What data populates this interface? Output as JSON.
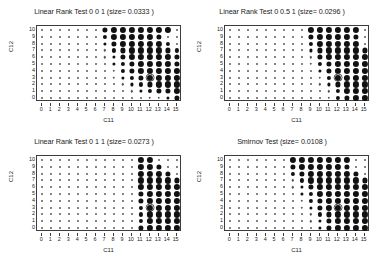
{
  "figure": {
    "background": "#ffffff",
    "marker_color": "#111111",
    "axis_color": "#3c3c3c",
    "layout": "2x2 grid of scatter panels"
  },
  "panels": [
    {
      "id": "panel-top-left",
      "title": "Linear Rank Test 0 0 1 (size= 0.0333 )",
      "xlabel": "C11",
      "ylabel": "C12"
    },
    {
      "id": "panel-top-right",
      "title": "Linear Rank Test 0 0.5 1 (size= 0.0296 )",
      "xlabel": "C11",
      "ylabel": "C12"
    },
    {
      "id": "panel-bottom-left",
      "title": "Linear Rank Test 0 1 1 (size= 0.0273 )",
      "xlabel": "C11",
      "ylabel": "C12"
    },
    {
      "id": "panel-bottom-right",
      "title": "Smirnov Test (size= 0.0108 )",
      "xlabel": "C11",
      "ylabel": "C12"
    }
  ],
  "axes_common": {
    "xticks": [
      0,
      1,
      2,
      3,
      4,
      5,
      6,
      7,
      8,
      9,
      10,
      11,
      12,
      13,
      14,
      15
    ],
    "yticks": [
      0,
      1,
      2,
      3,
      4,
      5,
      6,
      7,
      8,
      9,
      10
    ],
    "xlim": [
      -0.6,
      15.6
    ],
    "ylim": [
      -0.6,
      10.6
    ],
    "grid": false
  },
  "chart_data": [
    {
      "type": "scatter",
      "panel": "panel-top-left",
      "title": "Linear Rank Test 0 0 1 (size= 0.0333 )",
      "xlabel": "C11",
      "ylabel": "C12",
      "xlim": [
        -0.6,
        15.6
      ],
      "ylim": [
        -0.6,
        10.6
      ],
      "grid": false,
      "legend": null,
      "note": "Bubble plot: marker radius encodes test power at each (C11,C12) grid point. sizes[row] runs y=10 (top) down to y=0 (bottom); each row lists x=0..15.",
      "highlight": {
        "x": 12,
        "y": 3,
        "style": "open ring around marker"
      },
      "sizes": [
        [
          1,
          1,
          1,
          1,
          1,
          1,
          1,
          5,
          6,
          6,
          6,
          6,
          6,
          6,
          6,
          1
        ],
        [
          1,
          1,
          1,
          1,
          1,
          1,
          1,
          4,
          6,
          6,
          6,
          6,
          6,
          5,
          1,
          1
        ],
        [
          1,
          1,
          1,
          1,
          1,
          1,
          1,
          3,
          5,
          6,
          6,
          6,
          6,
          6,
          4,
          1
        ],
        [
          1,
          1,
          1,
          1,
          1,
          1,
          1,
          2,
          4,
          5,
          6,
          6,
          6,
          6,
          5,
          4
        ],
        [
          1,
          1,
          1,
          1,
          1,
          1,
          1,
          2,
          3,
          5,
          6,
          6,
          6,
          6,
          6,
          5
        ],
        [
          1,
          1,
          1,
          1,
          1,
          1,
          1,
          1,
          3,
          4,
          5,
          6,
          6,
          6,
          6,
          5
        ],
        [
          1,
          1,
          1,
          1,
          1,
          1,
          1,
          1,
          2,
          4,
          5,
          6,
          6,
          6,
          6,
          6
        ],
        [
          1,
          1,
          1,
          1,
          1,
          1,
          1,
          1,
          2,
          3,
          4,
          5,
          6,
          6,
          6,
          6
        ],
        [
          1,
          1,
          1,
          1,
          1,
          1,
          1,
          1,
          1,
          2,
          3,
          4,
          5,
          6,
          6,
          6
        ],
        [
          1,
          1,
          1,
          1,
          1,
          1,
          1,
          1,
          1,
          1,
          2,
          3,
          4,
          5,
          5,
          6
        ],
        [
          1,
          1,
          1,
          1,
          1,
          1,
          1,
          1,
          1,
          1,
          1,
          1,
          2,
          2,
          3,
          5
        ]
      ]
    },
    {
      "type": "scatter",
      "panel": "panel-top-right",
      "title": "Linear Rank Test 0 0.5 1 (size= 0.0296 )",
      "xlabel": "C11",
      "ylabel": "C12",
      "xlim": [
        -0.6,
        15.6
      ],
      "ylim": [
        -0.6,
        10.6
      ],
      "grid": false,
      "legend": null,
      "note": "Bubble plot: marker radius encodes test power at each (C11,C12) grid point.",
      "highlight": {
        "x": 12,
        "y": 3,
        "style": "open ring around marker"
      },
      "sizes": [
        [
          1,
          1,
          1,
          1,
          1,
          1,
          1,
          1,
          1,
          6,
          6,
          6,
          6,
          6,
          6,
          1
        ],
        [
          1,
          1,
          1,
          1,
          1,
          1,
          1,
          1,
          1,
          5,
          6,
          6,
          6,
          6,
          5,
          1
        ],
        [
          1,
          1,
          1,
          1,
          1,
          1,
          1,
          1,
          1,
          4,
          6,
          6,
          6,
          6,
          6,
          1
        ],
        [
          1,
          1,
          1,
          1,
          1,
          1,
          1,
          1,
          1,
          3,
          5,
          6,
          6,
          6,
          6,
          5
        ],
        [
          1,
          1,
          1,
          1,
          1,
          1,
          1,
          1,
          1,
          2,
          5,
          6,
          6,
          6,
          6,
          6
        ],
        [
          1,
          1,
          1,
          1,
          1,
          1,
          1,
          1,
          1,
          2,
          4,
          5,
          6,
          6,
          6,
          6
        ],
        [
          1,
          1,
          1,
          1,
          1,
          1,
          1,
          1,
          1,
          1,
          3,
          5,
          6,
          6,
          6,
          6
        ],
        [
          1,
          1,
          1,
          1,
          1,
          1,
          1,
          1,
          1,
          1,
          2,
          4,
          6,
          6,
          6,
          6
        ],
        [
          1,
          1,
          1,
          1,
          1,
          1,
          1,
          1,
          1,
          1,
          2,
          3,
          5,
          6,
          6,
          6
        ],
        [
          1,
          1,
          1,
          1,
          1,
          1,
          1,
          1,
          1,
          1,
          1,
          2,
          4,
          6,
          6,
          6
        ],
        [
          1,
          1,
          1,
          1,
          1,
          1,
          1,
          1,
          1,
          1,
          1,
          2,
          4,
          5,
          6,
          6
        ]
      ]
    },
    {
      "type": "scatter",
      "panel": "panel-bottom-left",
      "title": "Linear Rank Test 0 1 1 (size= 0.0273 )",
      "xlabel": "C11",
      "ylabel": "C12",
      "xlim": [
        -0.6,
        15.6
      ],
      "ylim": [
        -0.6,
        10.6
      ],
      "grid": false,
      "legend": null,
      "note": "Bubble plot: marker radius encodes test power at each (C11,C12) grid point.",
      "highlight": {
        "x": 12,
        "y": 3,
        "style": "open ring around marker"
      },
      "sizes": [
        [
          1,
          1,
          1,
          1,
          1,
          1,
          1,
          1,
          1,
          1,
          1,
          6,
          6,
          1,
          1,
          1
        ],
        [
          1,
          1,
          1,
          1,
          1,
          1,
          1,
          1,
          1,
          1,
          1,
          6,
          6,
          5,
          1,
          1
        ],
        [
          1,
          1,
          1,
          1,
          1,
          1,
          1,
          1,
          1,
          1,
          1,
          6,
          6,
          6,
          5,
          1
        ],
        [
          1,
          1,
          1,
          1,
          1,
          1,
          1,
          1,
          1,
          1,
          1,
          6,
          6,
          6,
          6,
          5
        ],
        [
          1,
          1,
          1,
          1,
          1,
          1,
          1,
          1,
          1,
          1,
          1,
          6,
          6,
          6,
          6,
          6
        ],
        [
          1,
          1,
          1,
          1,
          1,
          1,
          1,
          1,
          1,
          1,
          1,
          5,
          6,
          6,
          6,
          6
        ],
        [
          1,
          1,
          1,
          1,
          1,
          1,
          1,
          1,
          1,
          1,
          1,
          5,
          6,
          6,
          6,
          6
        ],
        [
          1,
          1,
          1,
          1,
          1,
          1,
          1,
          1,
          1,
          1,
          1,
          4,
          6,
          6,
          6,
          6
        ],
        [
          1,
          1,
          1,
          1,
          1,
          1,
          1,
          1,
          1,
          1,
          1,
          4,
          6,
          6,
          6,
          6
        ],
        [
          1,
          1,
          1,
          1,
          1,
          1,
          1,
          1,
          1,
          1,
          1,
          4,
          6,
          6,
          6,
          6
        ],
        [
          1,
          1,
          1,
          1,
          1,
          1,
          1,
          1,
          1,
          1,
          1,
          5,
          6,
          6,
          6,
          6
        ]
      ]
    },
    {
      "type": "scatter",
      "panel": "panel-bottom-right",
      "title": "Smirnov Test (size= 0.0108 )",
      "xlabel": "C11",
      "ylabel": "C12",
      "xlim": [
        -0.6,
        15.6
      ],
      "ylim": [
        -0.6,
        10.6
      ],
      "grid": false,
      "legend": null,
      "note": "Bubble plot: marker radius encodes test power at each (C11,C12) grid point.",
      "highlight": {
        "x": 12,
        "y": 3,
        "style": "open ring around marker"
      },
      "sizes": [
        [
          1,
          1,
          1,
          1,
          1,
          1,
          1,
          6,
          6,
          6,
          6,
          6,
          6,
          6,
          1,
          1
        ],
        [
          1,
          1,
          1,
          1,
          1,
          1,
          1,
          5,
          6,
          6,
          6,
          6,
          6,
          5,
          1,
          1
        ],
        [
          1,
          1,
          1,
          1,
          1,
          1,
          1,
          4,
          5,
          6,
          6,
          6,
          6,
          6,
          5,
          1
        ],
        [
          1,
          1,
          1,
          1,
          1,
          1,
          1,
          2,
          4,
          6,
          6,
          6,
          6,
          6,
          6,
          5
        ],
        [
          1,
          1,
          1,
          1,
          1,
          1,
          1,
          2,
          3,
          5,
          6,
          6,
          6,
          6,
          6,
          6
        ],
        [
          1,
          1,
          1,
          1,
          1,
          1,
          1,
          1,
          3,
          4,
          6,
          6,
          6,
          6,
          6,
          6
        ],
        [
          1,
          1,
          1,
          1,
          1,
          1,
          1,
          1,
          2,
          4,
          5,
          6,
          6,
          6,
          6,
          6
        ],
        [
          1,
          1,
          1,
          1,
          1,
          1,
          1,
          1,
          2,
          3,
          5,
          6,
          6,
          6,
          6,
          6
        ],
        [
          1,
          1,
          1,
          1,
          1,
          1,
          1,
          1,
          1,
          2,
          4,
          5,
          6,
          6,
          6,
          6
        ],
        [
          1,
          1,
          1,
          1,
          1,
          1,
          1,
          1,
          1,
          2,
          3,
          5,
          6,
          6,
          6,
          6
        ],
        [
          1,
          1,
          1,
          1,
          1,
          1,
          1,
          1,
          1,
          1,
          3,
          5,
          6,
          6,
          6,
          6
        ]
      ]
    }
  ]
}
